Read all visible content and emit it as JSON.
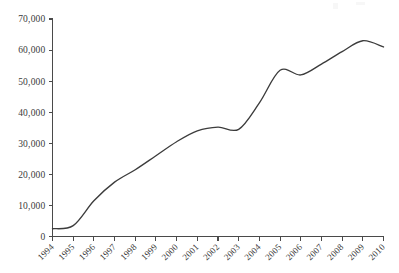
{
  "figure": {
    "background_color": "#ffffff",
    "line_color": "#3c3c3c",
    "axis_color": "#4a4a4a",
    "label_color": "#3a3a3a"
  },
  "chart_data": {
    "type": "line",
    "title": "",
    "subtitle": "",
    "xlabel": "",
    "ylabel": "",
    "legend": [],
    "legend_position": "none",
    "grid": false,
    "smoothed": true,
    "categories": [
      "1994",
      "1995",
      "1996",
      "1997",
      "1998",
      "1999",
      "2000",
      "2001",
      "2002",
      "2003",
      "2004",
      "2005",
      "2006",
      "2007",
      "2008",
      "2009",
      "2010"
    ],
    "values": [
      2500,
      3500,
      11500,
      17500,
      21500,
      26000,
      30500,
      34000,
      35200,
      34500,
      43000,
      53500,
      52000,
      55500,
      59500,
      63000,
      61000
    ],
    "xlim": [
      "1994",
      "2010"
    ],
    "ylim": [
      0,
      70000
    ],
    "ytick_values": [
      0,
      10000,
      20000,
      30000,
      40000,
      50000,
      60000,
      70000
    ],
    "ytick_labels": [
      "0",
      "10,000",
      "20,000",
      "30,000",
      "40,000",
      "50,000",
      "60,000",
      "70,000"
    ],
    "xtick_labels": [
      "1994",
      "1995",
      "1996",
      "1997",
      "1998",
      "1999",
      "2000",
      "2001",
      "2002",
      "2003",
      "2004",
      "2005",
      "2006",
      "2007",
      "2008",
      "2009",
      "2010"
    ],
    "xtick_rotation_degrees": 45,
    "annotations": []
  }
}
